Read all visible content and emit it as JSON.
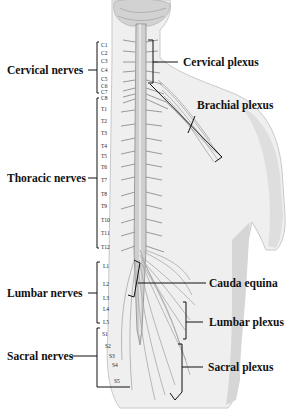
{
  "diagram": {
    "left_labels": [
      {
        "id": "cervical",
        "text": "Cervical nerves"
      },
      {
        "id": "thoracic",
        "text": "Thoracic nerves"
      },
      {
        "id": "lumbar",
        "text": "Lumbar nerves"
      },
      {
        "id": "sacral",
        "text": "Sacral nerves"
      }
    ],
    "right_labels": [
      {
        "id": "cervical_plexus",
        "text": "Cervical plexus"
      },
      {
        "id": "brachial_plexus",
        "text": "Brachial plexus"
      },
      {
        "id": "cauda_equina",
        "text": "Cauda equina"
      },
      {
        "id": "lumbar_plexus",
        "text": "Lumbar plexus"
      },
      {
        "id": "sacral_plexus",
        "text": "Sacral plexus"
      }
    ],
    "segments": {
      "cervical": [
        "C1",
        "C2",
        "C3",
        "C4",
        "C5",
        "C6",
        "C7",
        "C8"
      ],
      "thoracic": [
        "T1",
        "T2",
        "T3",
        "T4",
        "T5",
        "T6",
        "T7",
        "T8",
        "T9",
        "T10",
        "T11",
        "T12"
      ],
      "lumbar": [
        "L1",
        "L2",
        "L3",
        "L4",
        "L5"
      ],
      "sacral": [
        "S1",
        "S2",
        "S3",
        "S4",
        "S5"
      ]
    },
    "colors": {
      "line": "#111111",
      "body_fill": "#efefef",
      "body_shade": "#d8d8d8",
      "nerve": "#9a9a9a",
      "cord": "#bdbdbd"
    }
  }
}
